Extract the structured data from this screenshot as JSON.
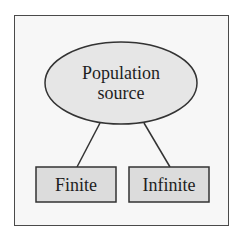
{
  "diagram": {
    "title": "",
    "root": {
      "shape": "ellipse",
      "label_lines": [
        "Population",
        "source"
      ],
      "fill": "#e6e6e6",
      "stroke": "#333333"
    },
    "children": [
      {
        "shape": "rectangle",
        "label": "Finite",
        "fill": "#dcdcdc",
        "stroke": "#333333"
      },
      {
        "shape": "rectangle",
        "label": "Infinite",
        "fill": "#dcdcdc",
        "stroke": "#333333"
      }
    ],
    "edges": [
      {
        "from": "Population source",
        "to": "Finite"
      },
      {
        "from": "Population source",
        "to": "Infinite"
      }
    ],
    "colors": {
      "frame_border": "#4a4a4a",
      "frame_fill": "#f7f7f7",
      "node_fill": "#dcdcdc",
      "ellipse_fill": "#e6e6e6",
      "line": "#333333",
      "text": "#1e1e1e"
    }
  }
}
